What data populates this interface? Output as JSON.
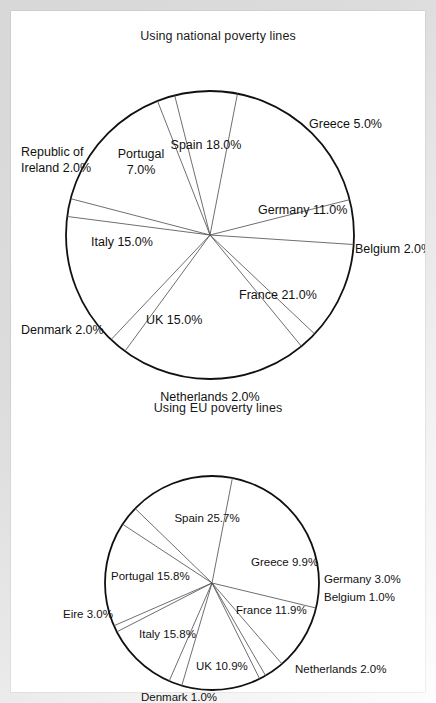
{
  "document": {
    "background_color": "#ffffff",
    "frame_color": "#dcdcdc",
    "outline_color": "#111111",
    "spoke_color": "#555555"
  },
  "charts": [
    {
      "id": "national",
      "title": "Using national poverty lines",
      "name": "pie-chart-national-poverty-lines"
    },
    {
      "id": "eu",
      "title": "Using EU poverty lines",
      "name": "pie-chart-eu-poverty-lines"
    }
  ],
  "chart_data": [
    {
      "type": "pie",
      "title": "Using national poverty lines",
      "xlabel": "",
      "ylabel": "",
      "legend": "none",
      "labels_on_slices": true,
      "categories": [
        "Spain",
        "Greece",
        "Germany",
        "Belgium",
        "France",
        "Netherlands",
        "UK",
        "Denmark",
        "Italy",
        "Republic of Ireland",
        "Portugal"
      ],
      "values": [
        18.0,
        5.0,
        11.0,
        2.0,
        21.0,
        2.0,
        15.0,
        2.0,
        15.0,
        2.0,
        7.0
      ],
      "labels": [
        "Spain 18.0%",
        "Greece 5.0%",
        "Germany 11.0%",
        "Belgium 2.0%",
        "France 21.0%",
        "Netherlands 2.0%",
        "UK 15.0%",
        "Denmark 2.0%",
        "Italy 15.0%",
        "Republic of Ireland 2.0%",
        "Portugal 7.0%"
      ],
      "geometry": {
        "cx": 199,
        "cy": 192,
        "r": 144,
        "start_angle_deg": -79
      },
      "label_placement": [
        {
          "key": "Spain",
          "lines": [
            "Spain 18.0%"
          ],
          "x": 195,
          "y": 103,
          "anchor": "middle",
          "leader": null
        },
        {
          "key": "Greece",
          "lines": [
            "Greece 5.0%"
          ],
          "x": 298,
          "y": 82,
          "anchor": "start",
          "leader": null
        },
        {
          "key": "Germany",
          "lines": [
            "Germany 11.0%"
          ],
          "x": 247,
          "y": 168,
          "anchor": "start",
          "leader": null
        },
        {
          "key": "Belgium",
          "lines": [
            "Belgium 2.0%"
          ],
          "x": 344,
          "y": 207,
          "anchor": "start",
          "leader": null
        },
        {
          "key": "France",
          "lines": [
            "France 21.0%"
          ],
          "x": 228,
          "y": 253,
          "anchor": "start",
          "leader": null
        },
        {
          "key": "Netherlands",
          "lines": [
            "Netherlands 2.0%"
          ],
          "x": 199,
          "y": 355,
          "anchor": "middle",
          "leader": null
        },
        {
          "key": "UK",
          "lines": [
            "UK 15.0%"
          ],
          "x": 135,
          "y": 278,
          "anchor": "start",
          "leader": null
        },
        {
          "key": "Denmark",
          "lines": [
            "Denmark 2.0%"
          ],
          "x": 10,
          "y": 288,
          "anchor": "start",
          "leader": null
        },
        {
          "key": "Italy",
          "lines": [
            "Italy 15.0%"
          ],
          "x": 80,
          "y": 200,
          "anchor": "start",
          "leader": null
        },
        {
          "key": "Ireland",
          "lines": [
            "Republic of",
            "Ireland 2.0%"
          ],
          "x": 10,
          "y": 110,
          "anchor": "start",
          "leader": null
        },
        {
          "key": "Portugal",
          "lines": [
            "Portugal",
            "7.0%"
          ],
          "x": 130,
          "y": 112,
          "anchor": "middle",
          "leader": null
        }
      ]
    },
    {
      "type": "pie",
      "title": "Using EU poverty lines",
      "xlabel": "",
      "ylabel": "",
      "legend": "none",
      "labels_on_slices": true,
      "categories": [
        "Spain",
        "Greece",
        "Germany",
        "Belgium",
        "France",
        "Netherlands",
        "UK",
        "Denmark",
        "Italy",
        "Eire",
        "Portugal"
      ],
      "values": [
        25.7,
        9.9,
        3.0,
        1.0,
        11.9,
        2.0,
        10.9,
        1.0,
        15.8,
        3.0,
        15.8
      ],
      "labels": [
        "Spain 25.7%",
        "Greece 9.9%",
        "Germany  3.0%",
        "Belgium 1.0%",
        "France 11.9%",
        "Netherlands 2.0%",
        "UK 10.9%",
        "Denmark 1.0%",
        "Italy 15.8%",
        "Eire 3.0%",
        "Portugal 15.8%"
      ],
      "geometry": {
        "cx": 201,
        "cy": 168,
        "r": 107,
        "start_angle_deg": -79
      },
      "label_placement": [
        {
          "key": "Spain",
          "lines": [
            "Spain 25.7%"
          ],
          "x": 196,
          "y": 104,
          "anchor": "middle",
          "leader": null
        },
        {
          "key": "Greece",
          "lines": [
            "Greece 9.9%"
          ],
          "x": 240,
          "y": 148,
          "anchor": "start",
          "leader": null
        },
        {
          "key": "Germany",
          "lines": [
            "Germany  3.0%"
          ],
          "x": 313,
          "y": 165,
          "anchor": "start",
          "leader": null
        },
        {
          "key": "Belgium",
          "lines": [
            "Belgium 1.0%"
          ],
          "x": 313,
          "y": 183,
          "anchor": "start",
          "leader": null
        },
        {
          "key": "France",
          "lines": [
            "France 11.9%"
          ],
          "x": 225,
          "y": 196,
          "anchor": "start",
          "leader": null
        },
        {
          "key": "Netherlands",
          "lines": [
            "Netherlands 2.0%"
          ],
          "x": 284,
          "y": 255,
          "anchor": "start",
          "leader": null
        },
        {
          "key": "UK",
          "lines": [
            "UK 10.9%"
          ],
          "x": 185,
          "y": 252,
          "anchor": "start",
          "leader": null
        },
        {
          "key": "Denmark",
          "lines": [
            "Denmark 1.0%"
          ],
          "x": 168,
          "y": 283,
          "anchor": "middle",
          "leader": null
        },
        {
          "key": "Italy",
          "lines": [
            "Italy 15.8%"
          ],
          "x": 128,
          "y": 220,
          "anchor": "start",
          "leader": null
        },
        {
          "key": "Eire",
          "lines": [
            "Eire 3.0%"
          ],
          "x": 52,
          "y": 200,
          "anchor": "start",
          "leader": null
        },
        {
          "key": "Portugal",
          "lines": [
            "Portugal 15.8%"
          ],
          "x": 100,
          "y": 162,
          "anchor": "start",
          "leader": null
        }
      ]
    }
  ]
}
